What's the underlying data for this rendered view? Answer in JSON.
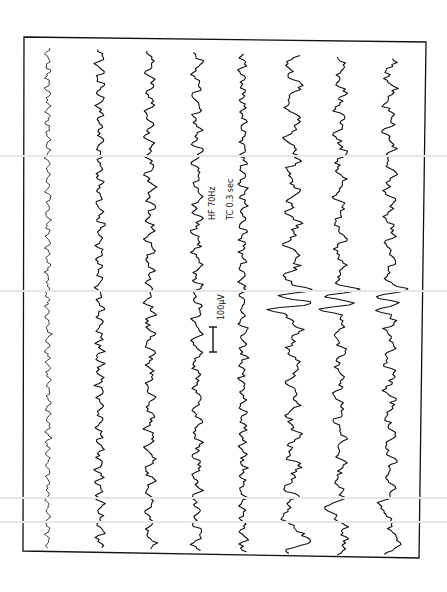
{
  "figure": {
    "type": "EEG recording (scanned, rotated 90°)",
    "channel_count": 8,
    "annotations": {
      "scale_bar_label": "100µV",
      "filter_hf": "HF  70Hz",
      "time_constant": "TC  0.3 sec"
    },
    "colors": {
      "ink": "#111111",
      "paper": "#ffffff",
      "scan_artifact": "#e6e6e6"
    },
    "channels": [
      {
        "x": 48,
        "amp": 3.5,
        "freq": 0.55,
        "style": "fast-low"
      },
      {
        "x": 100,
        "amp": 5,
        "freq": 0.45,
        "style": "fast"
      },
      {
        "x": 150,
        "amp": 6,
        "freq": 0.3,
        "style": "alpha"
      },
      {
        "x": 197,
        "amp": 6,
        "freq": 0.28,
        "style": "alpha"
      },
      {
        "x": 243,
        "amp": 5,
        "freq": 0.45,
        "style": "fast"
      },
      {
        "x": 293,
        "amp": 9,
        "freq": 0.18,
        "style": "slow-spike"
      },
      {
        "x": 340,
        "amp": 7,
        "freq": 0.22,
        "style": "slow-spike"
      },
      {
        "x": 390,
        "amp": 7,
        "freq": 0.22,
        "style": "slow-spike"
      }
    ],
    "spike_y": 300
  }
}
